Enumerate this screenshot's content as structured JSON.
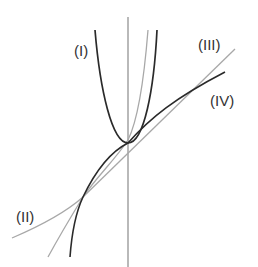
{
  "diagram": {
    "type": "function-graphs",
    "labels": {
      "I": "(I)",
      "II": "(II)",
      "III": "(III)",
      "IV": "(IV)"
    },
    "colors": {
      "dark": "#2a2a2a",
      "light": "#a8a8a8",
      "axis": "#8a8a8a",
      "label": "#333333"
    },
    "curves": [
      {
        "id": "I",
        "label": "(I)",
        "shade": "dark",
        "shape": "parabola"
      },
      {
        "id": "II",
        "label": "(II)",
        "shade": "light",
        "shape": "exponential"
      },
      {
        "id": "III",
        "label": "(III)",
        "shade": "light",
        "shape": "line"
      },
      {
        "id": "IV",
        "label": "(IV)",
        "shade": "dark",
        "shape": "cube-root-like"
      }
    ]
  }
}
